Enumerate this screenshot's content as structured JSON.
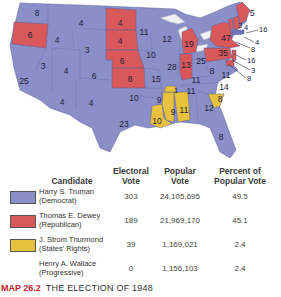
{
  "colors": {
    "democrat": "#8a8fc8",
    "republican": "#d9595a",
    "states_rights": "#e8c23c",
    "progressive": "#ffffff",
    "caption_accent": "#c8202e"
  },
  "map": {
    "states": [
      {
        "name": "Washington",
        "ev": "8",
        "party": "democrat"
      },
      {
        "name": "Oregon",
        "ev": "6",
        "party": "republican"
      },
      {
        "name": "California",
        "ev": "25",
        "party": "democrat"
      },
      {
        "name": "Idaho",
        "ev": "4",
        "party": "democrat"
      },
      {
        "name": "Nevada",
        "ev": "3",
        "party": "democrat"
      },
      {
        "name": "Montana",
        "ev": "4",
        "party": "democrat"
      },
      {
        "name": "Wyoming",
        "ev": "3",
        "party": "democrat"
      },
      {
        "name": "Utah",
        "ev": "4",
        "party": "democrat"
      },
      {
        "name": "Colorado",
        "ev": "6",
        "party": "democrat"
      },
      {
        "name": "Arizona",
        "ev": "4",
        "party": "democrat"
      },
      {
        "name": "New Mexico",
        "ev": "4",
        "party": "democrat"
      },
      {
        "name": "North Dakota",
        "ev": "4",
        "party": "republican"
      },
      {
        "name": "South Dakota",
        "ev": "4",
        "party": "republican"
      },
      {
        "name": "Nebraska",
        "ev": "6",
        "party": "republican"
      },
      {
        "name": "Kansas",
        "ev": "8",
        "party": "republican"
      },
      {
        "name": "Oklahoma",
        "ev": "10",
        "party": "democrat"
      },
      {
        "name": "Texas",
        "ev": "23",
        "party": "democrat"
      },
      {
        "name": "Minnesota",
        "ev": "11",
        "party": "democrat"
      },
      {
        "name": "Iowa",
        "ev": "10",
        "party": "democrat"
      },
      {
        "name": "Missouri",
        "ev": "15",
        "party": "democrat"
      },
      {
        "name": "Arkansas",
        "ev": "9",
        "party": "democrat"
      },
      {
        "name": "Louisiana",
        "ev": "10",
        "party": "states_rights"
      },
      {
        "name": "Wisconsin",
        "ev": "12",
        "party": "democrat"
      },
      {
        "name": "Illinois",
        "ev": "28",
        "party": "democrat"
      },
      {
        "name": "Michigan",
        "ev": "19",
        "party": "republican"
      },
      {
        "name": "Indiana",
        "ev": "13",
        "party": "republican"
      },
      {
        "name": "Ohio",
        "ev": "25",
        "party": "democrat"
      },
      {
        "name": "Kentucky",
        "ev": "11",
        "party": "democrat"
      },
      {
        "name": "Tennessee",
        "ev": "11",
        "party": "democrat"
      },
      {
        "name": "Tennessee (Thurmond elector)",
        "ev": "1",
        "party": "states_rights"
      },
      {
        "name": "Mississippi",
        "ev": "9",
        "party": "states_rights"
      },
      {
        "name": "Alabama",
        "ev": "11",
        "party": "states_rights"
      },
      {
        "name": "Georgia",
        "ev": "12",
        "party": "democrat"
      },
      {
        "name": "Florida",
        "ev": "8",
        "party": "democrat"
      },
      {
        "name": "South Carolina",
        "ev": "8",
        "party": "states_rights"
      },
      {
        "name": "North Carolina",
        "ev": "14",
        "party": "democrat"
      },
      {
        "name": "Virginia",
        "ev": "11",
        "party": "democrat"
      },
      {
        "name": "West Virginia",
        "ev": "8",
        "party": "democrat"
      },
      {
        "name": "Pennsylvania",
        "ev": "35",
        "party": "republican"
      },
      {
        "name": "New York",
        "ev": "47",
        "party": "republican"
      },
      {
        "name": "Vermont",
        "ev": "3",
        "party": "republican"
      },
      {
        "name": "New Hampshire",
        "ev": "4",
        "party": "republican"
      },
      {
        "name": "Maine",
        "ev": "5",
        "party": "republican"
      },
      {
        "name": "Massachusetts",
        "ev": "16",
        "party": "democrat"
      },
      {
        "name": "Rhode Island",
        "ev": "4",
        "party": "democrat"
      },
      {
        "name": "Connecticut",
        "ev": "8",
        "party": "republican"
      },
      {
        "name": "New Jersey",
        "ev": "16",
        "party": "republican"
      },
      {
        "name": "Delaware",
        "ev": "3",
        "party": "republican"
      },
      {
        "name": "Maryland",
        "ev": "8",
        "party": "republican"
      }
    ]
  },
  "legend": {
    "headers": {
      "candidate": "Candidate",
      "electoral": "Electoral Vote",
      "popular": "Popular Vote",
      "percent": "Percent of Popular Vote"
    },
    "rows": [
      {
        "name": "Harry S. Truman",
        "party": "(Democrat)",
        "electoral": "303",
        "popular": "24,105,695",
        "percent": "49.5"
      },
      {
        "name": "Thomas E. Dewey",
        "party": "(Republican)",
        "electoral": "189",
        "popular": "21,969,170",
        "percent": "45.1"
      },
      {
        "name": "J. Strom Thurmond",
        "party": "(States' Rights)",
        "electoral": "39",
        "popular": "1,169,021",
        "percent": "2.4"
      },
      {
        "name": "Henry A. Wallace",
        "party": "(Progressive)",
        "electoral": "0",
        "popular": "1,156,103",
        "percent": "2.4"
      }
    ]
  },
  "caption": {
    "map_number": "MAP 26.2",
    "title": "THE ELECTION OF 1948"
  }
}
